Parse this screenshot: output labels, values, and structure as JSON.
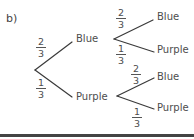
{
  "part_label": "b)",
  "tree": {
    "first_stage": {
      "upper": {
        "outcome": "Blue",
        "probability": {
          "num": "2",
          "den": "3"
        }
      },
      "lower": {
        "outcome": "Purple",
        "probability": {
          "num": "1",
          "den": "3"
        }
      }
    },
    "second_stage_after_blue": {
      "upper": {
        "outcome": "Blue",
        "probability": {
          "num": "2",
          "den": "3"
        }
      },
      "lower": {
        "outcome": "Purple",
        "probability": {
          "num": "1",
          "den": "3"
        }
      }
    },
    "second_stage_after_purple": {
      "upper": {
        "outcome": "Blue",
        "probability": {
          "num": "2",
          "den": "3"
        }
      },
      "lower": {
        "outcome": "Purple",
        "probability": {
          "num": "1",
          "den": "3"
        }
      }
    }
  },
  "colors": {
    "line": "#3a3a3a",
    "text": "#4d4d4d",
    "rule": "#444444"
  }
}
